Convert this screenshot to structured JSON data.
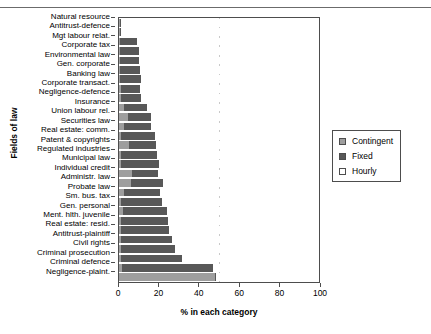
{
  "chart_data": {
    "type": "bar",
    "orientation": "horizontal",
    "stacked": true,
    "title": "",
    "xlabel": "% in each category",
    "ylabel": "Fields of law",
    "xlim": [
      0,
      100
    ],
    "xticks": [
      0,
      20,
      40,
      60,
      80,
      100
    ],
    "grid": false,
    "legend_position": "right",
    "categories": [
      "Natural resource",
      "Antitrust-defence",
      "Mgt labour relat.",
      "Corporate tax",
      "Environmental law",
      "Gen. corporate",
      "Banking law",
      "Corporate transact.",
      "Negligence-defence",
      "Insurance",
      "Union labour rel.",
      "Securities law",
      "Real estate: comm.",
      "Patent & copyrights",
      "Regulated industries",
      "Municipal law",
      "Individual credit",
      "Administr. law",
      "Probate law",
      "Sm. bus. tax",
      "Gen. personal",
      "Ment. hlth. juvenile",
      "Real estate: resid.",
      "Antitrust-plaintiff",
      "Civil rights",
      "Criminal prosecution",
      "Criminal defence",
      "Negligence-plaint."
    ],
    "series": [
      {
        "name": "Contingent",
        "color": "#9e9e9e",
        "values": [
          0.5,
          0.5,
          0.5,
          0.5,
          0.5,
          0.5,
          0.5,
          1.0,
          1.0,
          2.5,
          4.5,
          2.5,
          1.0,
          5.0,
          1.0,
          1.0,
          6.5,
          6.0,
          2.5,
          1.0,
          2.0,
          1.0,
          1.0,
          1.0,
          1.0,
          1.0,
          1.5,
          48.0
        ]
      },
      {
        "name": "Fixed",
        "color": "#585858",
        "values": [
          0.5,
          0.5,
          8.5,
          9.5,
          9.5,
          10.0,
          10.5,
          9.5,
          10.0,
          11.5,
          11.5,
          13.5,
          17.0,
          13.5,
          18.0,
          19.0,
          13.0,
          16.0,
          18.0,
          20.5,
          22.0,
          23.5,
          24.0,
          25.5,
          27.0,
          30.5,
          45.5,
          0.5
        ]
      },
      {
        "name": "Hourly",
        "color": "#ffffff",
        "values": [
          99.0,
          99.0,
          91.0,
          90.0,
          90.0,
          89.5,
          89.0,
          89.5,
          89.0,
          86.0,
          84.0,
          84.0,
          82.0,
          81.5,
          81.0,
          80.0,
          80.5,
          78.0,
          79.5,
          78.5,
          76.0,
          75.5,
          75.0,
          73.5,
          72.0,
          68.5,
          53.0,
          51.5
        ]
      }
    ]
  },
  "legend": {
    "items": [
      {
        "label": "Contingent"
      },
      {
        "label": "Fixed"
      },
      {
        "label": "Hourly"
      }
    ]
  },
  "axes": {
    "x_title": "% in each category",
    "y_title": "Fields of law",
    "x_tick_labels": [
      "0",
      "20",
      "40",
      "60",
      "80",
      "100"
    ]
  }
}
